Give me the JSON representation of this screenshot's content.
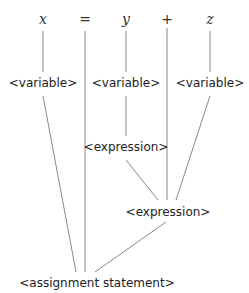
{
  "diagram": {
    "type": "parse-tree",
    "tokens": [
      {
        "id": "x",
        "label": "x",
        "kind": "term",
        "x": 43
      },
      {
        "id": "eq",
        "label": "=",
        "kind": "op",
        "x": 85
      },
      {
        "id": "y",
        "label": "y",
        "kind": "term",
        "x": 126
      },
      {
        "id": "plus",
        "label": "+",
        "kind": "op",
        "x": 167
      },
      {
        "id": "z",
        "label": "z",
        "kind": "term",
        "x": 210
      }
    ],
    "nodes": {
      "var_x": {
        "label": "<variable>"
      },
      "var_y": {
        "label": "<variable>"
      },
      "var_z": {
        "label": "<variable>"
      },
      "expr_inner": {
        "label": "<expression>"
      },
      "expr_outer": {
        "label": "<expression>"
      },
      "root": {
        "label": "<assignment statement>"
      }
    },
    "edges": [
      [
        "x",
        "var_x"
      ],
      [
        "y",
        "var_y"
      ],
      [
        "z",
        "var_z"
      ],
      [
        "var_y",
        "expr_inner"
      ],
      [
        "expr_inner",
        "expr_outer"
      ],
      [
        "plus",
        "expr_outer"
      ],
      [
        "var_z",
        "expr_outer"
      ],
      [
        "var_x",
        "root"
      ],
      [
        "eq",
        "root"
      ],
      [
        "expr_outer",
        "root"
      ]
    ],
    "colors": {
      "line": "#888888",
      "text": "#222222"
    }
  }
}
